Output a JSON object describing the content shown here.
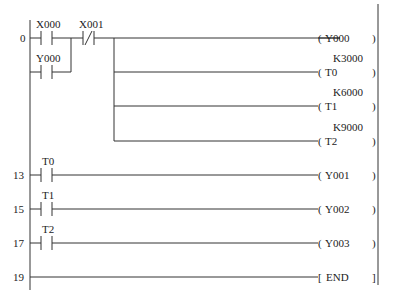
{
  "diagram": {
    "type": "ladder-logic",
    "rungs": [
      {
        "step": "0",
        "contacts": [
          {
            "label": "X000",
            "type": "NO"
          },
          {
            "label": "X001",
            "type": "NC"
          }
        ],
        "parallel": [
          {
            "label": "Y000",
            "type": "NO"
          }
        ],
        "outputs": [
          {
            "label": "Y000",
            "constant": ""
          },
          {
            "label": "T0",
            "constant": "K3000"
          },
          {
            "label": "T1",
            "constant": "K6000"
          },
          {
            "label": "T2",
            "constant": "K9000"
          }
        ]
      },
      {
        "step": "13",
        "contacts": [
          {
            "label": "T0",
            "type": "NO"
          }
        ],
        "outputs": [
          {
            "label": "Y001"
          }
        ]
      },
      {
        "step": "15",
        "contacts": [
          {
            "label": "T1",
            "type": "NO"
          }
        ],
        "outputs": [
          {
            "label": "Y002"
          }
        ]
      },
      {
        "step": "17",
        "contacts": [
          {
            "label": "T2",
            "type": "NO"
          }
        ],
        "outputs": [
          {
            "label": "Y003"
          }
        ]
      },
      {
        "step": "19",
        "contacts": [],
        "outputs": [
          {
            "label": "END",
            "instruction": true
          }
        ]
      }
    ]
  },
  "labels": {
    "step0": "0",
    "step13": "13",
    "step15": "15",
    "step17": "17",
    "step19": "19",
    "x000": "X000",
    "x001": "X001",
    "y000_contact": "Y000",
    "coil_y000": "Y000",
    "coil_t0": "T0",
    "coil_t1": "T1",
    "coil_t2": "T2",
    "k_t0": "K3000",
    "k_t1": "K6000",
    "k_t2": "K9000",
    "t0": "T0",
    "t1": "T1",
    "t2": "T2",
    "coil_y001": "Y001",
    "coil_y002": "Y002",
    "coil_y003": "Y003",
    "end": "END"
  }
}
